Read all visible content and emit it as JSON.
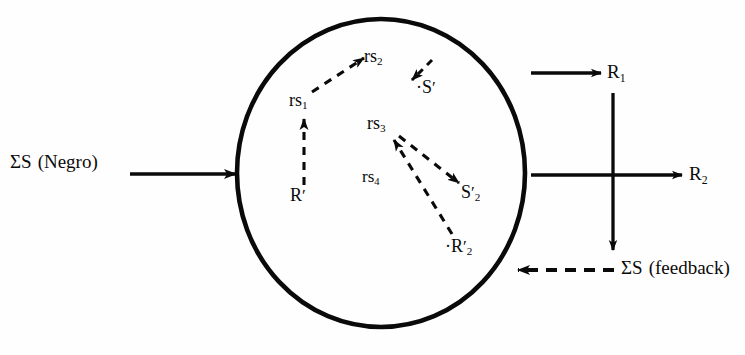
{
  "figure": {
    "type": "block-flow diagram"
  },
  "organism": {
    "shape_name": "organism-ellipse"
  },
  "input": {
    "label_sigma": "ΣS",
    "label_paren": "(Negro)",
    "arrow_name": "input-arrow"
  },
  "internal": {
    "nodes": [
      {
        "id": "rs1",
        "base": "rs",
        "sub": "1",
        "prime": "",
        "prefix": ""
      },
      {
        "id": "rs2",
        "base": "rs",
        "sub": "2",
        "prime": "",
        "prefix": ""
      },
      {
        "id": "rs3",
        "base": "rs",
        "sub": "3",
        "prime": "",
        "prefix": ""
      },
      {
        "id": "rs4",
        "base": "rs",
        "sub": "4",
        "prime": "",
        "prefix": ""
      },
      {
        "id": "Rp",
        "base": "R",
        "sub": "",
        "prime": "′",
        "prefix": ""
      },
      {
        "id": "Sp",
        "base": "S",
        "sub": "",
        "prime": "′",
        "prefix": "·"
      },
      {
        "id": "Sp2",
        "base": "S",
        "sub": "2",
        "prime": "′",
        "prefix": ""
      },
      {
        "id": "Rp2",
        "base": "R",
        "sub": "2",
        "prime": "′",
        "prefix": "·"
      }
    ],
    "edges": [
      {
        "from": "Rp",
        "to": "rs1",
        "style": "dashed",
        "name": "edge-Rprime-to-rs1"
      },
      {
        "from": "rs1",
        "to": "rs2",
        "style": "dashed",
        "name": "edge-rs1-to-rs2"
      },
      {
        "from": "rs2",
        "to": "Sp",
        "style": "dashed",
        "name": "edge-rs2-to-Sprime"
      },
      {
        "from": "rs3",
        "to": "Sp2",
        "style": "dashed",
        "name": "edge-rs3-to-Sprime2"
      },
      {
        "from": "Rp2",
        "to": "rs3",
        "style": "dashed",
        "name": "edge-Rprime2-to-rs3"
      }
    ]
  },
  "outputs": {
    "r1": {
      "base": "R",
      "sub": "1",
      "arrow_name": "output-arrow-r1"
    },
    "r2": {
      "base": "R",
      "sub": "2",
      "arrow_name": "output-arrow-r2"
    },
    "down": {
      "arrow_name": "vertical-coupling-arrow"
    }
  },
  "feedback": {
    "label_sigma": "ΣS",
    "label_paren": "(feedback)",
    "arrow_name": "feedback-arrow",
    "style": "dashed"
  },
  "colors": {
    "ink": "#0a0a0a",
    "paper": "#fefefe"
  }
}
